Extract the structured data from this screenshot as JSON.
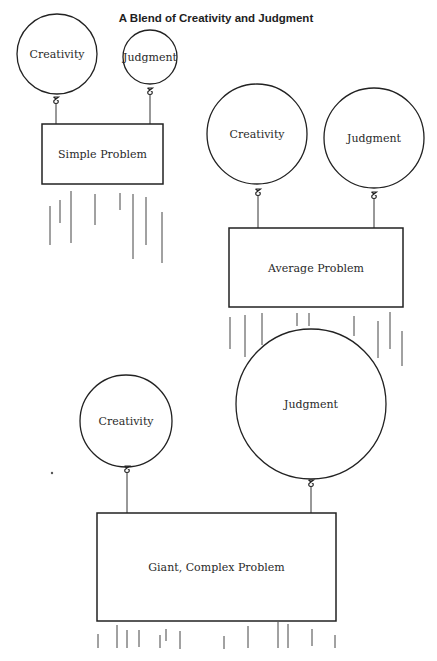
{
  "title": "A Blend of Creativity and Judgment",
  "colors": {
    "ink": "#222222",
    "background": "#ffffff"
  },
  "scenes": [
    {
      "id": "simple",
      "problem_label": "Simple Problem",
      "box": {
        "x": 42,
        "y": 124,
        "w": 121,
        "h": 60
      },
      "balloons": [
        {
          "label": "Creativity",
          "cx": 57,
          "cy": 54,
          "r": 40,
          "knot_y": 100,
          "string_x": 56
        },
        {
          "label": "Judgment",
          "cx": 150,
          "cy": 57,
          "r": 27,
          "knot_y": 91,
          "string_x": 150
        }
      ],
      "fall_lines": [
        [
          50,
          206,
          245
        ],
        [
          60,
          200,
          223
        ],
        [
          71,
          191,
          243
        ],
        [
          95,
          194,
          225
        ],
        [
          120,
          193,
          210
        ],
        [
          133,
          194,
          259
        ],
        [
          146,
          197,
          245
        ],
        [
          162,
          212,
          263
        ]
      ]
    },
    {
      "id": "average",
      "problem_label": "Average Problem",
      "box": {
        "x": 229,
        "y": 228,
        "w": 174,
        "h": 79
      },
      "balloons": [
        {
          "label": "Creativity",
          "cx": 257,
          "cy": 134,
          "r": 50,
          "knot_y": 192,
          "string_x": 258
        },
        {
          "label": "Judgment",
          "cx": 374,
          "cy": 138,
          "r": 50,
          "knot_y": 195,
          "string_x": 374
        }
      ],
      "fall_lines": [
        [
          230,
          317,
          349
        ],
        [
          245,
          315,
          357
        ],
        [
          262,
          313,
          345
        ],
        [
          297,
          313,
          326
        ],
        [
          309,
          313,
          326
        ],
        [
          354,
          316,
          336
        ],
        [
          378,
          321,
          358
        ],
        [
          390,
          312,
          349
        ],
        [
          402,
          331,
          366
        ]
      ]
    },
    {
      "id": "giant",
      "problem_label": "Giant, Complex Problem",
      "box": {
        "x": 97,
        "y": 513,
        "w": 239,
        "h": 108
      },
      "balloons": [
        {
          "label": "Creativity",
          "cx": 126,
          "cy": 421,
          "r": 46,
          "knot_y": 469,
          "string_x": 127
        },
        {
          "label": "Judgment",
          "cx": 311,
          "cy": 404,
          "r": 75,
          "knot_y": 483,
          "string_x": 311
        }
      ],
      "fall_lines": [
        [
          98,
          634,
          648
        ],
        [
          117,
          625,
          648
        ],
        [
          127,
          630,
          648
        ],
        [
          139,
          630,
          647
        ],
        [
          160,
          635,
          648
        ],
        [
          166,
          629,
          641
        ],
        [
          180,
          631,
          649
        ],
        [
          224,
          636,
          649
        ],
        [
          248,
          626,
          648
        ],
        [
          278,
          622,
          648
        ],
        [
          288,
          624,
          648
        ],
        [
          312,
          629,
          646
        ],
        [
          335,
          635,
          648
        ]
      ]
    }
  ]
}
